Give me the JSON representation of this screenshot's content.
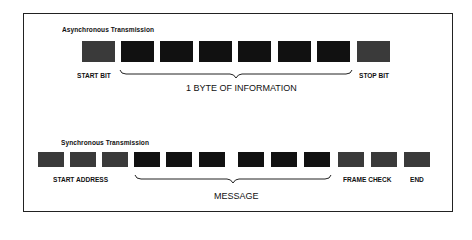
{
  "colors": {
    "data_bit": "#111111",
    "control_bit": "#3a3a3a",
    "border": "#222222",
    "text": "#111111"
  },
  "async": {
    "title": "Asynchronous Transmission",
    "start_label": "START BIT",
    "stop_label": "STOP BIT",
    "caption": "1 BYTE OF INFORMATION",
    "boxes": [
      {
        "type": "start"
      },
      {
        "type": "data"
      },
      {
        "type": "data"
      },
      {
        "type": "data"
      },
      {
        "type": "data"
      },
      {
        "type": "data"
      },
      {
        "type": "data"
      },
      {
        "type": "stop"
      }
    ]
  },
  "sync": {
    "title": "Synchronous Transmission",
    "start_label": "START ADDRESS",
    "frame_check_label": "FRAME CHECK",
    "end_label": "END",
    "caption": "MESSAGE",
    "boxes": [
      {
        "type": "address"
      },
      {
        "type": "address"
      },
      {
        "type": "address"
      },
      {
        "type": "message"
      },
      {
        "type": "message"
      },
      {
        "type": "message"
      },
      {
        "type": "message"
      },
      {
        "type": "message"
      },
      {
        "type": "message"
      },
      {
        "type": "frame_check"
      },
      {
        "type": "frame_check"
      },
      {
        "type": "end"
      }
    ]
  }
}
